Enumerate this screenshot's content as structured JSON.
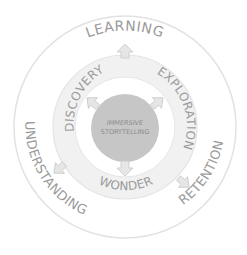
{
  "diagram": {
    "center_label_line1": "IMMERSIVE",
    "center_label_line2": "STORYTELLING",
    "inner_ring": {
      "labels": [
        "DISCOVERY",
        "EXPLORATION",
        "WONDER"
      ]
    },
    "outer_ring": {
      "labels": [
        "LEARNING",
        "UNDERSTANDING",
        "RETENTION"
      ]
    },
    "colors": {
      "background": "#ffffff",
      "outer_circle_fill": "#ffffff",
      "outer_circle_stroke": "#e2e2e2",
      "middle_ring_fill": "#f1f1f1",
      "middle_ring_stroke": "#e4e4e4",
      "inner_disk_fill": "#ffffff",
      "center_fill": "#c6c6c6",
      "text": "#9a9a9a",
      "center_text": "#8c8c8c",
      "arrow_fill": "#e6e6e6",
      "arrow_stroke": "#c8c8c8"
    },
    "arrows": [
      {
        "name": "arrow-to-learning",
        "angle": -90
      },
      {
        "name": "arrow-to-discovery",
        "angle": -140
      },
      {
        "name": "arrow-to-exploration",
        "angle": -40
      },
      {
        "name": "arrow-to-wonder",
        "angle": 90
      },
      {
        "name": "arrow-to-understanding",
        "angle": 140
      },
      {
        "name": "arrow-to-retention",
        "angle": 40
      }
    ]
  }
}
